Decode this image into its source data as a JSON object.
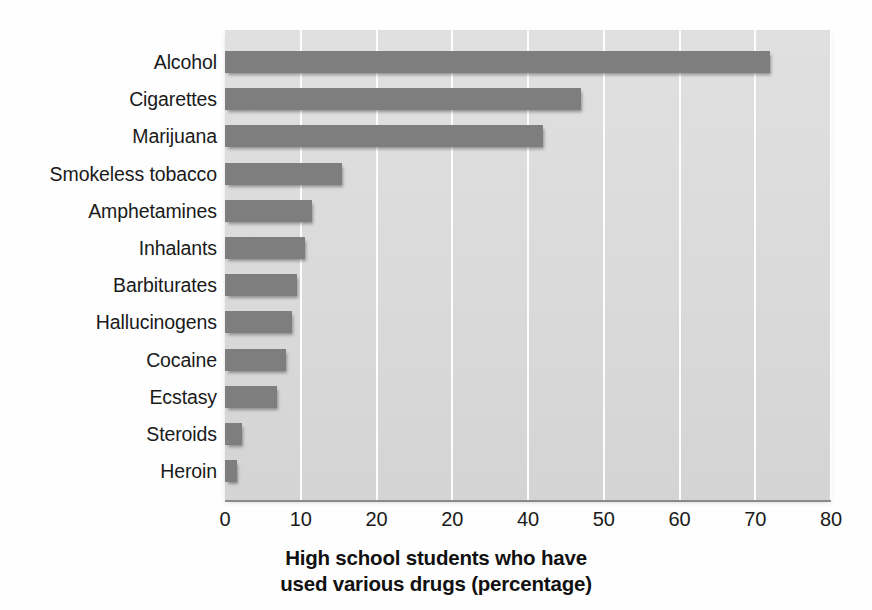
{
  "chart_data": {
    "type": "bar",
    "orientation": "horizontal",
    "title": "",
    "xlabel_lines": [
      "High school students who have",
      "used various drugs (percentage)"
    ],
    "ylabel": "",
    "xlim": [
      0,
      80
    ],
    "xtick_values": [
      0,
      10,
      20,
      30,
      40,
      50,
      60,
      70,
      80
    ],
    "xtick_labels": [
      "0",
      "10",
      "20",
      "20",
      "40",
      "50",
      "60",
      "70",
      "80"
    ],
    "grid": true,
    "legend": "none",
    "categories": [
      "Alcohol",
      "Cigarettes",
      "Marijuana",
      "Smokeless tobacco",
      "Amphetamines",
      "Inhalants",
      "Barbiturates",
      "Hallucinogens",
      "Cocaine",
      "Ecstasy",
      "Steroids",
      "Heroin"
    ],
    "values": [
      72,
      47,
      42,
      15.5,
      11.5,
      10.5,
      9.5,
      8.8,
      8,
      6.8,
      2.2,
      1.6
    ],
    "bar_color": "#7e7e7e",
    "plot_background": "#dcdcdc",
    "gridline_color": "#fdfdfd",
    "page_background": "#ffffff"
  }
}
